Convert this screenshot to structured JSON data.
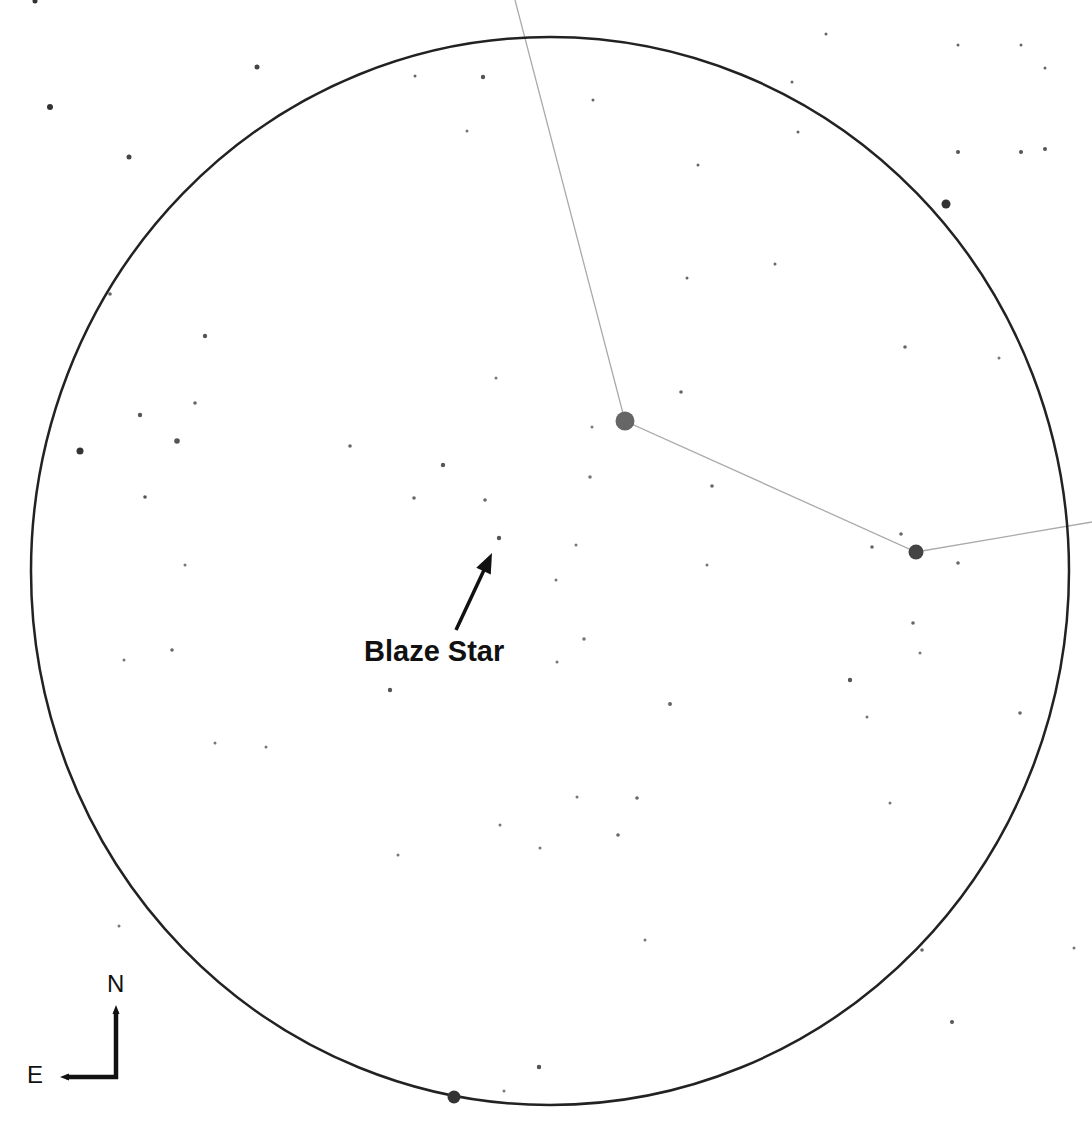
{
  "chart": {
    "type": "star-finder-chart",
    "width": 1092,
    "height": 1126,
    "background": "#ffffff",
    "field_of_view": {
      "shape": "ellipse",
      "cx": 550,
      "cy": 571,
      "rx": 519,
      "ry": 534,
      "stroke": "#222222",
      "stroke_width": 2.5
    },
    "constellation_lines": {
      "stroke": "#aaaaaa",
      "stroke_width": 1.3,
      "points": [
        [
          515,
          0
        ],
        [
          625,
          421
        ],
        [
          916,
          552
        ],
        [
          1092,
          522
        ]
      ]
    },
    "stars": [
      {
        "x": 625,
        "y": 421,
        "r": 9.5,
        "color": "#666666"
      },
      {
        "x": 916,
        "y": 552,
        "r": 7.5,
        "color": "#444444"
      },
      {
        "x": 946,
        "y": 204,
        "r": 4.5,
        "color": "#333333"
      },
      {
        "x": 454,
        "y": 1097,
        "r": 6.5,
        "color": "#333333"
      },
      {
        "x": 80,
        "y": 451,
        "r": 3.5,
        "color": "#333333"
      },
      {
        "x": 35,
        "y": 1,
        "r": 2.5,
        "color": "#333333"
      },
      {
        "x": 50,
        "y": 107,
        "r": 3,
        "color": "#333333"
      },
      {
        "x": 257,
        "y": 67,
        "r": 2.5,
        "color": "#444444"
      },
      {
        "x": 129,
        "y": 157,
        "r": 2.5,
        "color": "#444444"
      },
      {
        "x": 415,
        "y": 76,
        "r": 1.5,
        "color": "#666666"
      },
      {
        "x": 483,
        "y": 77,
        "r": 2.2,
        "color": "#555555"
      },
      {
        "x": 467,
        "y": 131,
        "r": 1.5,
        "color": "#777777"
      },
      {
        "x": 110,
        "y": 294,
        "r": 1.8,
        "color": "#666666"
      },
      {
        "x": 593,
        "y": 100,
        "r": 1.5,
        "color": "#666666"
      },
      {
        "x": 826,
        "y": 34,
        "r": 1.5,
        "color": "#666666"
      },
      {
        "x": 792,
        "y": 82,
        "r": 1.5,
        "color": "#666666"
      },
      {
        "x": 698,
        "y": 165,
        "r": 1.5,
        "color": "#666666"
      },
      {
        "x": 798,
        "y": 132,
        "r": 1.5,
        "color": "#666666"
      },
      {
        "x": 1021,
        "y": 45,
        "r": 1.5,
        "color": "#666666"
      },
      {
        "x": 1021,
        "y": 152,
        "r": 2,
        "color": "#555555"
      },
      {
        "x": 958,
        "y": 45,
        "r": 1.5,
        "color": "#666666"
      },
      {
        "x": 1045,
        "y": 68,
        "r": 1.5,
        "color": "#666666"
      },
      {
        "x": 958,
        "y": 152,
        "r": 2,
        "color": "#555555"
      },
      {
        "x": 1045,
        "y": 149,
        "r": 2,
        "color": "#555555"
      },
      {
        "x": 775,
        "y": 264,
        "r": 1.5,
        "color": "#666666"
      },
      {
        "x": 687,
        "y": 278,
        "r": 1.5,
        "color": "#666666"
      },
      {
        "x": 205,
        "y": 336,
        "r": 2.2,
        "color": "#555555"
      },
      {
        "x": 195,
        "y": 403,
        "r": 1.8,
        "color": "#666666"
      },
      {
        "x": 140,
        "y": 415,
        "r": 2.2,
        "color": "#555555"
      },
      {
        "x": 177,
        "y": 441,
        "r": 2.8,
        "color": "#555555"
      },
      {
        "x": 350,
        "y": 446,
        "r": 1.8,
        "color": "#666666"
      },
      {
        "x": 443,
        "y": 465,
        "r": 2.2,
        "color": "#555555"
      },
      {
        "x": 414,
        "y": 498,
        "r": 1.8,
        "color": "#666666"
      },
      {
        "x": 485,
        "y": 500,
        "r": 1.8,
        "color": "#666666"
      },
      {
        "x": 145,
        "y": 497,
        "r": 1.8,
        "color": "#555555"
      },
      {
        "x": 496,
        "y": 378,
        "r": 1.5,
        "color": "#777777"
      },
      {
        "x": 499,
        "y": 538,
        "r": 2.2,
        "color": "#555555"
      },
      {
        "x": 905,
        "y": 347,
        "r": 1.8,
        "color": "#666666"
      },
      {
        "x": 999,
        "y": 358,
        "r": 1.5,
        "color": "#777777"
      },
      {
        "x": 681,
        "y": 392,
        "r": 1.8,
        "color": "#666666"
      },
      {
        "x": 592,
        "y": 427,
        "r": 1.5,
        "color": "#777777"
      },
      {
        "x": 590,
        "y": 477,
        "r": 1.8,
        "color": "#777777"
      },
      {
        "x": 712,
        "y": 486,
        "r": 1.8,
        "color": "#666666"
      },
      {
        "x": 901,
        "y": 534,
        "r": 1.8,
        "color": "#666666"
      },
      {
        "x": 872,
        "y": 547,
        "r": 1.8,
        "color": "#666666"
      },
      {
        "x": 576,
        "y": 545,
        "r": 1.5,
        "color": "#777777"
      },
      {
        "x": 707,
        "y": 565,
        "r": 1.5,
        "color": "#777777"
      },
      {
        "x": 958,
        "y": 563,
        "r": 1.8,
        "color": "#666666"
      },
      {
        "x": 185,
        "y": 565,
        "r": 1.5,
        "color": "#777777"
      },
      {
        "x": 172,
        "y": 650,
        "r": 1.8,
        "color": "#666666"
      },
      {
        "x": 124,
        "y": 660,
        "r": 1.5,
        "color": "#777777"
      },
      {
        "x": 390,
        "y": 690,
        "r": 2.2,
        "color": "#555555"
      },
      {
        "x": 215,
        "y": 743,
        "r": 1.5,
        "color": "#777777"
      },
      {
        "x": 266,
        "y": 747,
        "r": 1.5,
        "color": "#777777"
      },
      {
        "x": 556,
        "y": 580,
        "r": 1.5,
        "color": "#777777"
      },
      {
        "x": 557,
        "y": 662,
        "r": 1.5,
        "color": "#777777"
      },
      {
        "x": 584,
        "y": 639,
        "r": 1.8,
        "color": "#777777"
      },
      {
        "x": 670,
        "y": 704,
        "r": 2,
        "color": "#666666"
      },
      {
        "x": 913,
        "y": 623,
        "r": 1.8,
        "color": "#666666"
      },
      {
        "x": 920,
        "y": 653,
        "r": 1.5,
        "color": "#777777"
      },
      {
        "x": 850,
        "y": 680,
        "r": 2.2,
        "color": "#555555"
      },
      {
        "x": 867,
        "y": 717,
        "r": 1.5,
        "color": "#777777"
      },
      {
        "x": 1020,
        "y": 713,
        "r": 1.8,
        "color": "#666666"
      },
      {
        "x": 577,
        "y": 797,
        "r": 1.5,
        "color": "#777777"
      },
      {
        "x": 637,
        "y": 798,
        "r": 1.8,
        "color": "#666666"
      },
      {
        "x": 890,
        "y": 803,
        "r": 1.5,
        "color": "#777777"
      },
      {
        "x": 618,
        "y": 835,
        "r": 1.8,
        "color": "#666666"
      },
      {
        "x": 500,
        "y": 825,
        "r": 1.5,
        "color": "#777777"
      },
      {
        "x": 540,
        "y": 848,
        "r": 1.5,
        "color": "#777777"
      },
      {
        "x": 398,
        "y": 855,
        "r": 1.5,
        "color": "#777777"
      },
      {
        "x": 119,
        "y": 926,
        "r": 1.5,
        "color": "#777777"
      },
      {
        "x": 645,
        "y": 940,
        "r": 1.5,
        "color": "#777777"
      },
      {
        "x": 922,
        "y": 950,
        "r": 1.8,
        "color": "#666666"
      },
      {
        "x": 1074,
        "y": 948,
        "r": 1.5,
        "color": "#777777"
      },
      {
        "x": 952,
        "y": 1022,
        "r": 2,
        "color": "#555555"
      },
      {
        "x": 539,
        "y": 1067,
        "r": 2.2,
        "color": "#555555"
      },
      {
        "x": 504,
        "y": 1091,
        "r": 1.5,
        "color": "#777777"
      },
      {
        "x": 539,
        "y": 1067,
        "r": 2,
        "color": "#555555"
      }
    ],
    "target": {
      "label": "Blaze Star",
      "star": {
        "x": 496,
        "y": 537
      },
      "arrow": {
        "x1": 456,
        "y1": 630,
        "x2": 492,
        "y2": 553,
        "color": "#111111",
        "stroke_width": 3.5
      }
    },
    "compass": {
      "north_label": "N",
      "east_label": "E",
      "color": "#111111",
      "corner": {
        "x": 116,
        "y": 1077
      },
      "north_tip": {
        "x": 116,
        "y": 1005
      },
      "east_tip": {
        "x": 60,
        "y": 1077
      }
    }
  }
}
